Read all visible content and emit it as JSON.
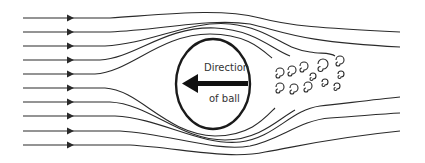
{
  "diagram": {
    "ball_label_line1": "Direction",
    "ball_label_line2": "of ball",
    "arrow_direction": "left",
    "colors": {
      "line": "#2a2a2a",
      "ball_outline": "#1a1a1a",
      "arrow": "#111111",
      "background": "#ffffff"
    },
    "streamline_count": 10,
    "wake": "turbulent swirls behind ball"
  }
}
